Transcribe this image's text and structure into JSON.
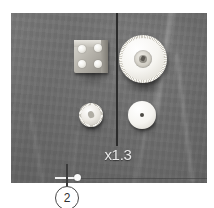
{
  "figure": {
    "name": "annotated-photo-figure",
    "background_color": "#ffffff"
  },
  "photo": {
    "name": "workbench-photo",
    "background_color": "#6f6f6f",
    "surface_description": "gray fabric work mat",
    "parts": [
      {
        "id": "block",
        "label": "square block with four screw heads",
        "color": "#c3c0b8",
        "screw_count": 4
      },
      {
        "id": "gear",
        "label": "large knurled gear wheel",
        "color": "#f6f5f1"
      },
      {
        "id": "knob",
        "label": "small knurled knob",
        "color": "#ece9e3"
      },
      {
        "id": "disc",
        "label": "smooth disc with center hole",
        "color": "#f5f4f0"
      }
    ]
  },
  "annotations": {
    "scale_label": "x1.3",
    "scale_label_color": "#e9e9e9",
    "callout_number": "2",
    "callout_border_color": "#4a4a4a",
    "leader_line_color": "#2b2b2b",
    "anchor_dot_color": "#fafafa",
    "baseline_color": "#3c3c3c"
  }
}
